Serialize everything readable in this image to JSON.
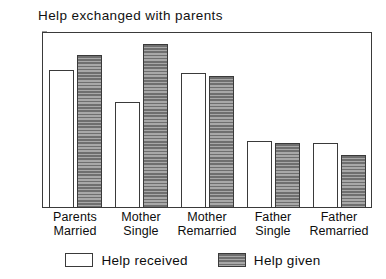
{
  "chart_data": {
    "type": "bar",
    "title": "Help exchanged with parents",
    "xlabel": "",
    "ylabel": "",
    "ylim": [
      0,
      0.6
    ],
    "yticks": [
      "0",
      "0.1",
      "0.2",
      "0.3",
      "0.4",
      "0.5",
      "0.6"
    ],
    "ytick_values": [
      0,
      0.1,
      0.2,
      0.3,
      0.4,
      0.5,
      0.6
    ],
    "grid": false,
    "legend_position": "bottom-center",
    "categories": [
      "Parents Married",
      "Mother Single",
      "Mother Remarried",
      "Father Single",
      "Father Remarried"
    ],
    "category_lines": [
      {
        "line1": "Parents",
        "line2": "Married"
      },
      {
        "line1": "Mother",
        "line2": "Single"
      },
      {
        "line1": "Mother",
        "line2": "Remarried"
      },
      {
        "line1": "Father",
        "line2": "Single"
      },
      {
        "line1": "Father",
        "line2": "Remarried"
      }
    ],
    "series": [
      {
        "name": "Help received",
        "fill": "white",
        "color": "#ffffff",
        "values": [
          0.47,
          0.36,
          0.46,
          0.23,
          0.22
        ]
      },
      {
        "name": "Help given",
        "fill": "gray-horizontal-hatch",
        "color": "#808080",
        "values": [
          0.52,
          0.56,
          0.45,
          0.22,
          0.18
        ]
      }
    ]
  },
  "legend": {
    "items": [
      {
        "label": "Help received",
        "swatch": "white-outline-swatch"
      },
      {
        "label": "Help given",
        "swatch": "gray-hatched-swatch"
      }
    ]
  }
}
